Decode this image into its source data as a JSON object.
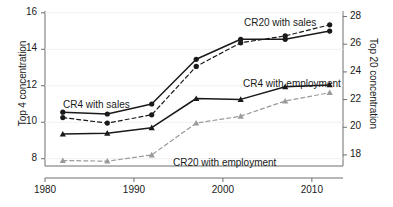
{
  "chart_data": {
    "type": "line",
    "title": "",
    "subtitle": "",
    "xlabel": "",
    "ylabel": "Top 4 concentration",
    "y2label": "Top 20 concentration",
    "x": [
      1982,
      1987,
      1992,
      1997,
      2002,
      2007,
      2012
    ],
    "xlim": [
      1980,
      2013.5
    ],
    "xticks": [
      1980,
      1990,
      2000,
      2010
    ],
    "xticklabels": [
      "1980",
      "1990",
      "2000",
      "2010"
    ],
    "ylim": [
      7.6,
      16.1
    ],
    "yticks": [
      8,
      10,
      12,
      14,
      16
    ],
    "yticklabels": [
      "8",
      "10",
      "12",
      "14",
      "16"
    ],
    "y2lim": [
      17.2,
      28.4
    ],
    "y2ticks": [
      18,
      20,
      22,
      24,
      26,
      28
    ],
    "y2ticklabels": [
      "18",
      "20",
      "22",
      "24",
      "26",
      "28"
    ],
    "grid": false,
    "legend_position": "inline-annotations",
    "series": [
      {
        "name": "CR4 with sales",
        "axis": "left",
        "line_style": "solid",
        "marker": "circle",
        "color": "#1a1a1a",
        "values": [
          10.55,
          10.45,
          11.0,
          13.45,
          14.55,
          14.55,
          15.0
        ]
      },
      {
        "name": "CR4 with employment",
        "axis": "left",
        "line_style": "solid",
        "marker": "triangle",
        "color": "#1a1a1a",
        "values": [
          9.35,
          9.4,
          9.7,
          11.3,
          11.25,
          11.95,
          12.05
        ]
      },
      {
        "name": "CR20 with sales",
        "axis": "right",
        "line_style": "dashed",
        "marker": "circle",
        "color": "#1a1a1a",
        "values": [
          20.7,
          20.3,
          20.9,
          24.4,
          26.1,
          26.6,
          27.4
        ]
      },
      {
        "name": "CR20 with employment",
        "axis": "right",
        "line_style": "dashed",
        "marker": "triangle",
        "color": "#9a9a9a",
        "values": [
          17.6,
          17.55,
          18.0,
          20.3,
          20.8,
          21.9,
          22.5
        ]
      }
    ],
    "annotations": [
      {
        "text": "CR4 with sales",
        "x_px": 63,
        "y_px": 99
      },
      {
        "text": "CR20 with sales",
        "x_px": 244,
        "y_px": 17
      },
      {
        "text": "CR4 with employment",
        "x_px": 243,
        "y_px": 78
      },
      {
        "text": "CR20 with employment",
        "x_px": 173,
        "y_px": 157
      }
    ]
  }
}
